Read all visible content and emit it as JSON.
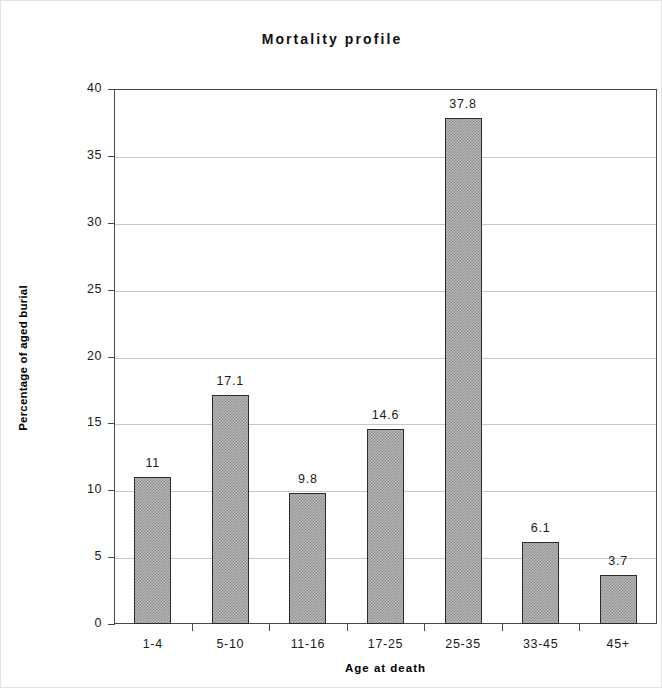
{
  "chart_data": {
    "type": "bar",
    "title": "Mortality profile",
    "xlabel": "Age at death",
    "ylabel": "Percentage of aged burial",
    "categories": [
      "1-4",
      "5-10",
      "11-16",
      "17-25",
      "25-35",
      "33-45",
      "45+"
    ],
    "values": [
      11,
      17.1,
      9.8,
      14.6,
      37.8,
      6.1,
      3.7
    ],
    "value_labels": [
      "11",
      "17.1",
      "9.8",
      "14.6",
      "37.8",
      "6.1",
      "3.7"
    ],
    "ylim": [
      0,
      40
    ],
    "ytick_values": [
      0,
      5,
      10,
      15,
      20,
      25,
      30,
      35,
      40
    ],
    "ytick_labels": [
      "0",
      "5",
      "10",
      "15",
      "20",
      "25",
      "30",
      "35",
      "40"
    ],
    "grid": "horizontal",
    "legend": "none",
    "bar_fill_color": "#b7b7b7",
    "bar_border_color": "#2b2b2b",
    "gridline_color": "#c8c8c8",
    "axis_color": "#4a4a4a"
  }
}
